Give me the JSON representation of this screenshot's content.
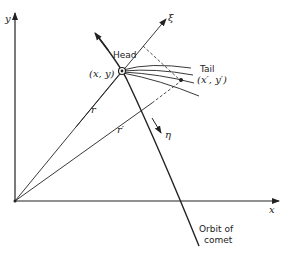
{
  "diagram": {
    "axes": {
      "x_label": "x",
      "y_label": "y"
    },
    "labels": {
      "head": "Head",
      "head_coords": "(x, y)",
      "tail": "Tail",
      "tail_coords": "(x′, y′)",
      "r": "r",
      "r_prime": "r′",
      "xi": "ξ",
      "eta": "η",
      "orbit_line1": "Orbit of",
      "orbit_line2": "comet"
    },
    "colors": {
      "ink": "#222222",
      "background": "#ffffff"
    }
  }
}
